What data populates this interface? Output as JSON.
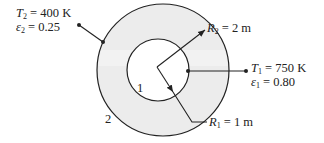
{
  "diagram": {
    "type": "concentric spheres radiation exchange",
    "colors": {
      "line": "#222222",
      "shade": "#e9e9e9",
      "background": "#ffffff"
    },
    "outer_surface": {
      "id_label": "2",
      "T_sym": "T",
      "T_sub": "2",
      "T_val": "= 400 K",
      "e_sym": "ε",
      "e_sub": "2",
      "e_val": "= 0.25",
      "R_sym": "R",
      "R_sub": "2",
      "R_val": "= 2 m"
    },
    "inner_surface": {
      "id_label": "1",
      "T_sym": "T",
      "T_sub": "1",
      "T_val": "= 750 K",
      "e_sym": "ε",
      "e_sub": "1",
      "e_val": "= 0.80",
      "R_sym": "R",
      "R_sub": "1",
      "R_val": "= 1 m"
    }
  }
}
